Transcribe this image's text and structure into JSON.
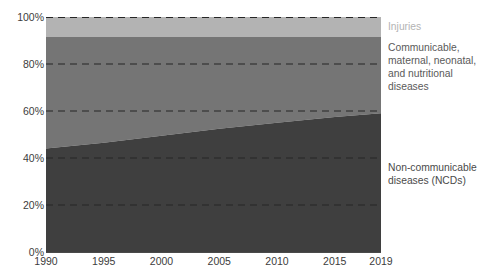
{
  "chart_data": {
    "type": "area",
    "title": "",
    "subtitle": "",
    "xlabel": "",
    "ylabel": "",
    "stacked": true,
    "normalized_percent": true,
    "grid": true,
    "grid_style": "dashed-horizontal",
    "legend_position": "right",
    "xlim": [
      1990,
      2019
    ],
    "ylim": [
      0,
      100
    ],
    "x": [
      1990,
      1995,
      2000,
      2005,
      2010,
      2015,
      2019
    ],
    "x_tick_labels": [
      "1990",
      "1995",
      "2000",
      "2005",
      "2010",
      "2015",
      "2019"
    ],
    "y_ticks": [
      0,
      20,
      40,
      60,
      80,
      100
    ],
    "y_tick_labels": [
      "0%",
      "20%",
      "40%",
      "60%",
      "80%",
      "100%"
    ],
    "series": [
      {
        "name": "Non-communicable diseases (NCDs)",
        "color": "#3f3f3f",
        "stack_order": 1,
        "values": [
          44.0,
          46.5,
          49.5,
          52.5,
          55.0,
          57.5,
          59.0
        ]
      },
      {
        "name": "Communicable, maternal, neonatal, and nutritional diseases",
        "color": "#757575",
        "stack_order": 2,
        "values": [
          47.5,
          45.0,
          42.0,
          39.0,
          36.5,
          34.0,
          32.5
        ]
      },
      {
        "name": "Injuries",
        "color": "#b3b3b3",
        "stack_order": 3,
        "values": [
          8.5,
          8.5,
          8.5,
          8.5,
          8.5,
          8.5,
          8.5
        ]
      }
    ],
    "boundaries_cumulative_percent": {
      "ncd_top": [
        44.0,
        46.5,
        49.5,
        52.5,
        55.0,
        57.5,
        59.0
      ],
      "communicable_top": [
        91.5,
        91.5,
        91.5,
        91.5,
        91.5,
        91.5,
        91.5
      ],
      "injuries_top": [
        100,
        100,
        100,
        100,
        100,
        100,
        100
      ]
    }
  },
  "legend": {
    "injuries": "Injuries",
    "communicable": "Communicable,\nmaternal, neonatal,\nand nutritional\ndiseases",
    "ncd": "Non-communicable\ndiseases (NCDs)"
  },
  "colors": {
    "injuries": "#b3b3b3",
    "communicable": "#757575",
    "ncd": "#3f3f3f",
    "gridline": "#2b2b2b",
    "axis": "#4a4a4a",
    "tick_text": "#3c3c3c"
  }
}
